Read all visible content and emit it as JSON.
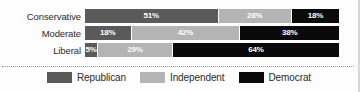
{
  "chart_data": {
    "type": "bar",
    "subtype": "stacked-horizontal-100pct",
    "title": "",
    "xlabel": "",
    "ylabel": "",
    "xlim": [
      0,
      100
    ],
    "grid": false,
    "legend_position": "bottom-center",
    "categories": [
      "Conservative",
      "Moderate",
      "Liberal"
    ],
    "series": [
      {
        "name": "Republican",
        "color": "#5a5a5a",
        "values": [
          51,
          18,
          5
        ]
      },
      {
        "name": "Independent",
        "color": "#b4b4b4",
        "values": [
          28,
          42,
          29
        ]
      },
      {
        "name": "Democrat",
        "color": "#0a0a0a",
        "values": [
          18,
          38,
          64
        ]
      }
    ],
    "value_labels": [
      [
        "51%",
        "28%",
        "18%"
      ],
      [
        "18%",
        "42%",
        "38%"
      ],
      [
        "5%",
        "29%",
        "64%"
      ]
    ]
  },
  "rows": [
    {
      "label": "Conservative",
      "segments": [
        {
          "party": "Republican",
          "label": "51%",
          "pct": 51
        },
        {
          "party": "Independent",
          "label": "28%",
          "pct": 28
        },
        {
          "party": "Democrat",
          "label": "18%",
          "pct": 18
        }
      ]
    },
    {
      "label": "Moderate",
      "segments": [
        {
          "party": "Republican",
          "label": "18%",
          "pct": 18
        },
        {
          "party": "Independent",
          "label": "42%",
          "pct": 42
        },
        {
          "party": "Democrat",
          "label": "38%",
          "pct": 38
        }
      ]
    },
    {
      "label": "Liberal",
      "segments": [
        {
          "party": "Republican",
          "label": "5%",
          "pct": 5
        },
        {
          "party": "Independent",
          "label": "29%",
          "pct": 29
        },
        {
          "party": "Democrat",
          "label": "64%",
          "pct": 64
        }
      ]
    }
  ],
  "legend": {
    "items": [
      {
        "label": "Republican",
        "color": "#5a5a5a"
      },
      {
        "label": "Independent",
        "color": "#b4b4b4"
      },
      {
        "label": "Democrat",
        "color": "#0a0a0a"
      }
    ]
  },
  "colors": {
    "republican": "#5a5a5a",
    "independent": "#b4b4b4",
    "democrat": "#0a0a0a",
    "background": "#fdfdfd",
    "label_text": "#2b2b2b",
    "divider": "#9a9a9a"
  }
}
